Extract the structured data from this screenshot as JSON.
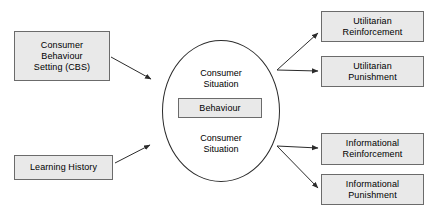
{
  "diagram": {
    "colors": {
      "box_fill": "#e9e9e9",
      "box_border": "#6b6b6b",
      "circle_border": "#2b2b2b",
      "arrow": "#2b2b2b",
      "text": "#000000",
      "background": "#ffffff"
    },
    "nodes": {
      "cbs": {
        "name": "Consumer Behaviour Setting (CBS)",
        "line1": "Consumer",
        "line2": "Behaviour",
        "line3": "Setting (CBS)"
      },
      "learning_history": {
        "label": "Learning History"
      },
      "consumer_situation_top": {
        "line1": "Consumer",
        "line2": "Situation"
      },
      "consumer_situation_bottom": {
        "line1": "Consumer",
        "line2": "Situation"
      },
      "behaviour": {
        "label": "Behaviour"
      },
      "utilitarian_reinforcement": {
        "line1": "Utilitarian",
        "line2": "Reinforcement"
      },
      "utilitarian_punishment": {
        "line1": "Utilitarian",
        "line2": "Punishment"
      },
      "informational_reinforcement": {
        "line1": "Informational",
        "line2": "Reinforcement"
      },
      "informational_punishment": {
        "line1": "Informational",
        "line2": "Punishment"
      }
    },
    "edges": [
      {
        "from": "cbs",
        "to": "consumer-situation-circle"
      },
      {
        "from": "learning_history",
        "to": "consumer-situation-circle"
      },
      {
        "from": "consumer-situation-circle",
        "to": "utilitarian_reinforcement"
      },
      {
        "from": "consumer-situation-circle",
        "to": "utilitarian_punishment"
      },
      {
        "from": "consumer-situation-circle",
        "to": "informational_reinforcement"
      },
      {
        "from": "consumer-situation-circle",
        "to": "informational_punishment"
      }
    ]
  }
}
